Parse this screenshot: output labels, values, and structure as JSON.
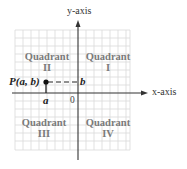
{
  "diagram": {
    "axes": {
      "x_label": "x-axis",
      "y_label": "y-axis",
      "origin_label": "0"
    },
    "quadrants": [
      {
        "id": "I",
        "line1": "Quadrant",
        "line2": "I"
      },
      {
        "id": "II",
        "line1": "Quadrant",
        "line2": "II"
      },
      {
        "id": "III",
        "line1": "Quadrant",
        "line2": "III"
      },
      {
        "id": "IV",
        "line1": "Quadrant",
        "line2": "IV"
      }
    ],
    "point": {
      "label": "P(a, b)",
      "x_label": "a",
      "y_label": "b"
    },
    "colors": {
      "grid": "#d8d8d8",
      "axis": "#333333",
      "quadrant_text": "#7a7a7a",
      "point": "#111111"
    }
  }
}
